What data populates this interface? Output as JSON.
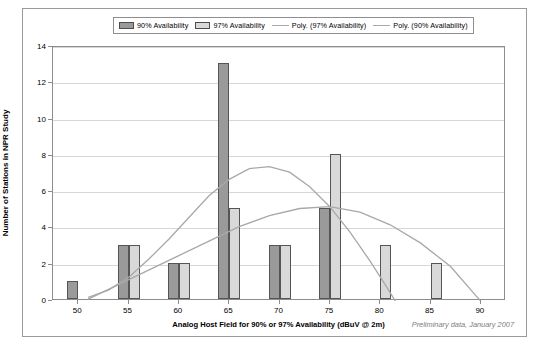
{
  "chart_data": {
    "type": "bar",
    "title": "",
    "xlabel": "Analog Host Field for 90% or 97% Availability (dBuV @ 2m)",
    "ylabel": "Number of Stations in NPR Study",
    "categories": [
      "50",
      "55",
      "60",
      "65",
      "70",
      "75",
      "80",
      "85",
      "90"
    ],
    "xlim": [
      47.5,
      92.5
    ],
    "ylim": [
      0,
      14
    ],
    "yticks": [
      "0",
      "2",
      "4",
      "6",
      "8",
      "10",
      "12",
      "14"
    ],
    "grid": "horizontal",
    "legend_position": "top",
    "series": [
      {
        "name": "90% Availability",
        "type": "bar",
        "color": "#9a9a9a",
        "values": [
          1,
          3,
          2,
          13,
          3,
          5,
          0,
          0,
          0
        ]
      },
      {
        "name": "97% Availability",
        "type": "bar",
        "color": "#d9d9d9",
        "values": [
          0,
          3,
          2,
          5,
          3,
          8,
          3,
          2,
          0
        ]
      },
      {
        "name": "Poly. (90% Availability)",
        "type": "line",
        "color": "#a8a8a8",
        "points": [
          [
            51,
            0.2
          ],
          [
            53,
            0.6
          ],
          [
            55,
            1.3
          ],
          [
            57,
            2.3
          ],
          [
            59,
            3.4
          ],
          [
            61,
            4.6
          ],
          [
            63,
            5.8
          ],
          [
            65,
            6.7
          ],
          [
            67,
            7.3
          ],
          [
            69,
            7.4
          ],
          [
            71,
            7.1
          ],
          [
            73,
            6.3
          ],
          [
            75,
            5.2
          ],
          [
            77,
            3.8
          ],
          [
            79,
            2.2
          ],
          [
            80.5,
            0.9
          ],
          [
            81.5,
            0
          ]
        ]
      },
      {
        "name": "Poly. (97% Availability)",
        "type": "line",
        "color": "#a8a8a8",
        "points": [
          [
            51,
            0.1
          ],
          [
            54,
            0.9
          ],
          [
            57,
            1.7
          ],
          [
            60,
            2.5
          ],
          [
            63,
            3.3
          ],
          [
            66,
            4.1
          ],
          [
            69,
            4.7
          ],
          [
            72,
            5.1
          ],
          [
            75,
            5.2
          ],
          [
            78,
            4.9
          ],
          [
            81,
            4.2
          ],
          [
            84,
            3.2
          ],
          [
            87,
            1.9
          ],
          [
            89.5,
            0.3
          ],
          [
            90,
            0
          ]
        ]
      }
    ],
    "annotation": "Preliminary data, January 2007"
  },
  "legend": {
    "items": [
      {
        "label": "90% Availability",
        "marker": "bar-swatch-dark"
      },
      {
        "label": "97% Availability",
        "marker": "bar-swatch-light"
      },
      {
        "label": "Poly. (97% Availability)",
        "marker": "line-swatch"
      },
      {
        "label": "Poly. (90% Availability)",
        "marker": "line-swatch"
      }
    ]
  }
}
